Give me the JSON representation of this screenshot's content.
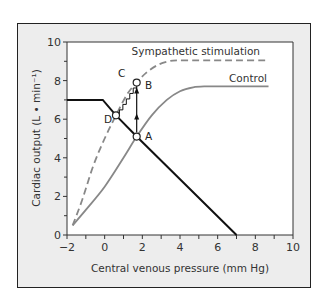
{
  "chart_data": {
    "type": "line",
    "title": "",
    "xlabel": "Central venous pressure (mm Hg)",
    "ylabel": "Cardiac output (L • min⁻¹)",
    "xlim": [
      -2,
      10
    ],
    "ylim": [
      0,
      10
    ],
    "x_ticks": [
      -2,
      0,
      2,
      4,
      6,
      8,
      10
    ],
    "x_tick_labels": [
      "−2",
      "0",
      "2",
      "4",
      "6",
      "8",
      "10"
    ],
    "x_minor_ticks": [
      -1,
      1,
      3,
      5,
      7,
      9
    ],
    "y_ticks": [
      0,
      2,
      4,
      6,
      8,
      10
    ],
    "y_tick_labels": [
      "0",
      "2",
      "4",
      "6",
      "8",
      "10"
    ],
    "y_minor_ticks": [
      1,
      3,
      5,
      7,
      9
    ],
    "grid": false,
    "series": [
      {
        "name": "Sympathetic stimulation",
        "style": "dashed",
        "color": "#888888",
        "x": [
          -1.7,
          -1.2,
          -0.6,
          0,
          0.6,
          1.2,
          1.7,
          2.2,
          2.8,
          3.4,
          3.9,
          5,
          6,
          7,
          8.7
        ],
        "y": [
          0.5,
          1.8,
          3.6,
          5.0,
          6.2,
          7.3,
          7.9,
          8.4,
          8.8,
          9.0,
          9.05,
          9.05,
          9.05,
          9.05,
          9.05
        ]
      },
      {
        "name": "Control",
        "style": "solid",
        "color": "#888888",
        "x": [
          -1.7,
          -1,
          0,
          1,
          1.7,
          2.5,
          3.3,
          4,
          4.7,
          5.4,
          6,
          7,
          8.7
        ],
        "y": [
          0.5,
          1.3,
          2.5,
          4.0,
          5.1,
          6.2,
          7.0,
          7.45,
          7.65,
          7.7,
          7.7,
          7.7,
          7.7
        ]
      },
      {
        "name": "Vascular function",
        "style": "solid",
        "color": "#111111",
        "x": [
          -2,
          -0.1,
          0.6,
          1.7,
          7
        ],
        "y": [
          7.0,
          7.0,
          6.2,
          5.1,
          0
        ]
      }
    ],
    "points": [
      {
        "label": "A",
        "x": 1.7,
        "y": 5.1
      },
      {
        "label": "B",
        "x": 1.7,
        "y": 7.9
      },
      {
        "label": "D",
        "x": 0.6,
        "y": 6.2
      }
    ],
    "annotations": [
      {
        "label": "C",
        "x": 1.15,
        "y": 8.25
      },
      {
        "type": "arrow",
        "from": [
          1.7,
          5.1
        ],
        "to": [
          1.7,
          7.9
        ],
        "description": "vertical arrow A to B"
      },
      {
        "type": "staircase",
        "from": [
          1.7,
          7.9
        ],
        "to": [
          0.6,
          6.2
        ],
        "description": "step transition C to D along sympathetic curve"
      }
    ],
    "legend": [
      {
        "label": "Sympathetic stimulation",
        "position": "above dashed curve, upper right"
      },
      {
        "label": "Control",
        "position": "above solid gray curve, right"
      }
    ]
  },
  "labels": {
    "legend_symp": "Sympathetic stimulation",
    "legend_control": "Control",
    "point_a": "A",
    "point_b": "B",
    "point_c": "C",
    "point_d": "D",
    "xlabel": "Central venous pressure (mm Hg)",
    "ylabel": "Cardiac output (L • min⁻¹)"
  }
}
